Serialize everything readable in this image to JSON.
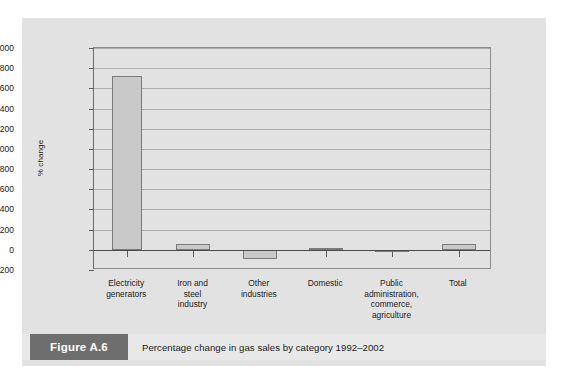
{
  "figure": {
    "tag": "Figure A.6",
    "caption": "Percentage change in gas sales by category 1992–2002"
  },
  "chart_data": {
    "type": "bar",
    "title": "",
    "xlabel": "",
    "ylabel": "% change",
    "ylim": [
      -200,
      2000
    ],
    "ytick_step": 200,
    "grid": true,
    "legend": "none",
    "yticks": [
      "2000",
      "1800",
      "1600",
      "1400",
      "1200",
      "1000",
      "800",
      "600",
      "400",
      "200",
      "0",
      "-200"
    ],
    "categories": [
      "Electricity generators",
      "Iron and steel industry",
      "Other industries",
      "Domestic",
      "Public administration, commerce, agriculture",
      "Total"
    ],
    "category_lines": [
      [
        "Electricity",
        "generators"
      ],
      [
        "Iron and",
        "steel",
        "industry"
      ],
      [
        "Other",
        "industries"
      ],
      [
        "Domestic"
      ],
      [
        "Public",
        "administration,",
        "commerce,",
        "agriculture"
      ],
      [
        "Total"
      ]
    ],
    "values": [
      1720,
      55,
      -90,
      12,
      -15,
      60
    ],
    "bar_color": "#c9c9c9",
    "bar_border_color": "#7a7a7a"
  }
}
